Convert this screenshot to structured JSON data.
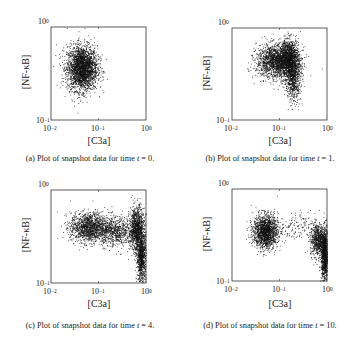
{
  "figure": {
    "axis_common": {
      "xlabel": "[C3a]",
      "ylabel": "[NF-κB]",
      "xticks": [
        {
          "base": "10",
          "exp": "−2"
        },
        {
          "base": "10",
          "exp": "−1"
        },
        {
          "base": "10",
          "exp": "0"
        }
      ],
      "yticks": [
        {
          "base": "10",
          "exp": "−1"
        },
        {
          "base": "10",
          "exp": "0"
        }
      ]
    },
    "panels": [
      {
        "id": "a",
        "caption_prefix": "(a) Plot of snapshot data for time ",
        "caption_var": "t",
        "caption_suffix": " = 0."
      },
      {
        "id": "b",
        "caption_prefix": "(b) Plot of snapshot data for time ",
        "caption_var": "t",
        "caption_suffix": " = 1."
      },
      {
        "id": "c",
        "caption_prefix": "(c) Plot of snapshot data for time ",
        "caption_var": "t",
        "caption_suffix": " = 4."
      },
      {
        "id": "d",
        "caption_prefix": "(d) Plot of snapshot data for time ",
        "caption_var": "t",
        "caption_suffix": " = 10."
      }
    ]
  },
  "colors": {
    "points": "#111111",
    "axes": "#333333",
    "text": "#1a1a1a"
  },
  "chart_data": [
    {
      "type": "scatter",
      "title": "(a) Plot of snapshot data for time t = 0.",
      "xlabel": "[C3a]",
      "ylabel": "[NF-κB]",
      "xscale": "log",
      "yscale": "log",
      "xlim": [
        0.01,
        1
      ],
      "ylim": [
        0.1,
        1
      ],
      "grid": false,
      "clusters_log10": [
        {
          "cx": -1.35,
          "cy": -0.44,
          "sx": 0.16,
          "sy": 0.12,
          "n": 2600
        }
      ]
    },
    {
      "type": "scatter",
      "title": "(b) Plot of snapshot data for time t = 1.",
      "xlabel": "[C3a]",
      "ylabel": "[NF-κB]",
      "xscale": "log",
      "yscale": "log",
      "xlim": [
        0.01,
        1
      ],
      "ylim": [
        0.1,
        1
      ],
      "grid": false,
      "clusters_log10": [
        {
          "cx": -1.05,
          "cy": -0.36,
          "sx": 0.22,
          "sy": 0.09,
          "n": 1900
        },
        {
          "cx": -0.8,
          "cy": -0.32,
          "sx": 0.1,
          "sy": 0.1,
          "n": 1000
        },
        {
          "cx": -0.72,
          "cy": -0.55,
          "sx": 0.08,
          "sy": 0.12,
          "n": 700
        }
      ]
    },
    {
      "type": "scatter",
      "title": "(c) Plot of snapshot data for time t = 4.",
      "xlabel": "[C3a]",
      "ylabel": "[NF-κB]",
      "xscale": "log",
      "yscale": "log",
      "xlim": [
        0.01,
        1
      ],
      "ylim": [
        0.1,
        1
      ],
      "grid": false,
      "clusters_log10": [
        {
          "cx": -1.2,
          "cy": -0.4,
          "sx": 0.2,
          "sy": 0.08,
          "n": 1400
        },
        {
          "cx": -0.65,
          "cy": -0.44,
          "sx": 0.18,
          "sy": 0.08,
          "n": 700
        },
        {
          "cx": -0.2,
          "cy": -0.42,
          "sx": 0.08,
          "sy": 0.12,
          "n": 1100
        },
        {
          "cx": -0.1,
          "cy": -0.72,
          "sx": 0.05,
          "sy": 0.13,
          "n": 900
        }
      ]
    },
    {
      "type": "scatter",
      "title": "(d) Plot of snapshot data for time t = 10.",
      "xlabel": "[C3a]",
      "ylabel": "[NF-κB]",
      "xscale": "log",
      "yscale": "log",
      "xlim": [
        0.01,
        1
      ],
      "ylim": [
        0.1,
        1
      ],
      "grid": false,
      "clusters_log10": [
        {
          "cx": -1.3,
          "cy": -0.46,
          "sx": 0.13,
          "sy": 0.09,
          "n": 1600
        },
        {
          "cx": -0.7,
          "cy": -0.42,
          "sx": 0.22,
          "sy": 0.08,
          "n": 150
        },
        {
          "cx": -0.2,
          "cy": -0.55,
          "sx": 0.08,
          "sy": 0.09,
          "n": 700
        },
        {
          "cx": -0.05,
          "cy": -0.72,
          "sx": 0.04,
          "sy": 0.14,
          "n": 1200
        }
      ]
    }
  ]
}
